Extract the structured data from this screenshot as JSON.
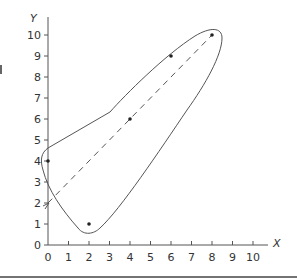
{
  "chart_data": {
    "type": "scatter",
    "title": "",
    "xlabel": "X",
    "ylabel": "Y",
    "xlim": [
      0,
      10
    ],
    "ylim": [
      0,
      10
    ],
    "x_ticks": [
      0,
      1,
      2,
      3,
      4,
      5,
      6,
      7,
      8,
      9,
      10
    ],
    "y_ticks": [
      0,
      1,
      2,
      3,
      4,
      5,
      6,
      7,
      8,
      9,
      10
    ],
    "grid": false,
    "series": [
      {
        "name": "points",
        "x": [
          0,
          2,
          4,
          6,
          8
        ],
        "y": [
          4,
          1,
          6,
          9,
          10
        ]
      }
    ],
    "fit_line": {
      "style": "dashed",
      "equation": "y = x + 2",
      "from": [
        0,
        2
      ],
      "to": [
        8,
        10
      ]
    },
    "annotations": [
      "closed envelope curve enclosing all points",
      "arrow marker at y-intercept (0, 2)"
    ]
  },
  "colors": {
    "ink": "#555555",
    "text": "#333333",
    "rule": "#444444"
  }
}
